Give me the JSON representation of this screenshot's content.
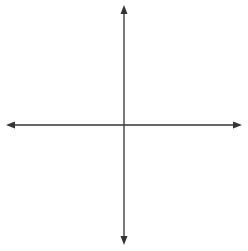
{
  "chart_data": {
    "type": "coordinate-grid",
    "title": "",
    "xlabel": "x",
    "ylabel": "y",
    "xlim": [
      -7,
      7
    ],
    "ylim": [
      -7,
      7
    ],
    "grid": true,
    "grid_step": 1,
    "x_tick_labels": [
      "-6",
      "-4",
      "-2",
      "2",
      "4",
      "6"
    ],
    "x_tick_values": [
      -6,
      -4,
      -2,
      2,
      4,
      6
    ],
    "y_tick_labels": [
      "6",
      "4",
      "2",
      "-2",
      "-4",
      "-6"
    ],
    "y_tick_values": [
      6,
      4,
      2,
      -2,
      -4,
      -6
    ],
    "origin_label": "0",
    "series": [],
    "colors": {
      "grid": "#cfcfcf",
      "axis": "#333333",
      "text": "#222222"
    }
  },
  "labels": {
    "x_axis": "x",
    "y_axis": "y",
    "origin": "0",
    "x_ticks": [
      "−6",
      "−4",
      "−2",
      "2",
      "4",
      "6"
    ],
    "y_ticks": [
      "6",
      "4",
      "2",
      "−2",
      "−4",
      "−6"
    ]
  }
}
